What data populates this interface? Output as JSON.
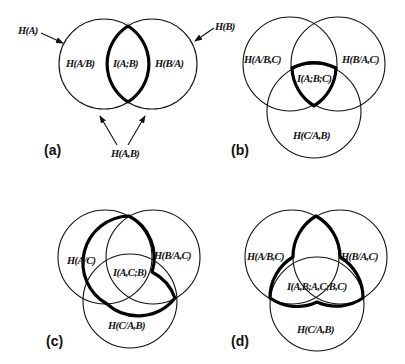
{
  "figure": {
    "panels": [
      {
        "id": "a",
        "label": "(a)",
        "regions": {
          "left": "H(A/B)",
          "center": "I(A;B)",
          "right": "H(B/A)"
        },
        "annotations": {
          "circle_a": "H(A)",
          "circle_b": "H(B)",
          "union": "H(A,B)"
        }
      },
      {
        "id": "b",
        "label": "(b)",
        "regions": {
          "left": "H(A/B,C)",
          "right": "H(B/A,C)",
          "bottom": "H(C/A,B)",
          "center": "I(A;B;C)"
        }
      },
      {
        "id": "c",
        "label": "(c)",
        "regions": {
          "left": "H(A/C)",
          "right": "H(B/A,C)",
          "bottom": "H(C/A,B)",
          "center": "I(A,C;B)"
        }
      },
      {
        "id": "d",
        "label": "(d)",
        "regions": {
          "left": "H(A/B,C)",
          "right": "H(B/A,C)",
          "bottom": "H(C/A,B)",
          "center": "I(A,B;A,C;B,C)"
        }
      }
    ],
    "colors": {
      "stroke": "#111111",
      "background": "#ffffff"
    }
  }
}
